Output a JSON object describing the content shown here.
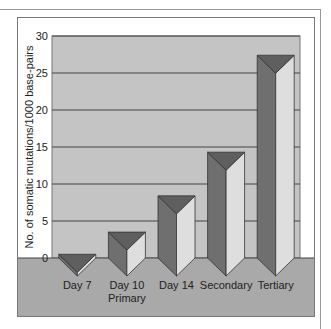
{
  "chart_data": {
    "type": "bar",
    "style": "3d-triangular-prism",
    "title": "",
    "xlabel": "",
    "ylabel": "No. of somatic mutations/1000 base-pairs",
    "categories": [
      "Day 7",
      "Day 10\nPrimary",
      "Day 14",
      "Secondary",
      "Tertiary"
    ],
    "category_lines": [
      [
        "Day 7"
      ],
      [
        "Day 10",
        "Primary"
      ],
      [
        "Day 14"
      ],
      [
        "Secondary"
      ],
      [
        "Tertiary"
      ]
    ],
    "values": [
      0.5,
      3.5,
      8.4,
      14.3,
      27.4
    ],
    "ylim": [
      0,
      30
    ],
    "yticks": [
      0,
      5,
      10,
      15,
      20,
      25,
      30
    ],
    "grid": true,
    "legend": null
  },
  "colors": {
    "plot_bg": "#c4c4c4",
    "floor": "#a9a9a9",
    "bar_dark": "#6f6f6f",
    "bar_light": "#dedede",
    "bar_top": "#5f5f5f",
    "grid": "#444444",
    "frame": "#777777"
  }
}
